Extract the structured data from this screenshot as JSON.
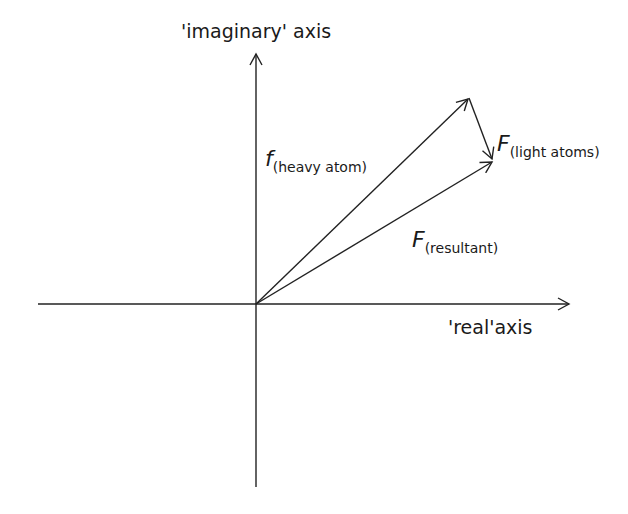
{
  "diagram": {
    "type": "vector-diagram",
    "labels": {
      "imaginary_axis": "'imaginary' axis",
      "real_axis": "'real'axis",
      "heavy_atom": {
        "symbol": "f",
        "subscript": "(heavy atom)"
      },
      "light_atoms": {
        "symbol": "F",
        "subscript": "(light atoms)"
      },
      "resultant": {
        "symbol": "F",
        "subscript": "(resultant)"
      }
    },
    "colors": {
      "line": "#222222",
      "background": "#ffffff"
    }
  }
}
